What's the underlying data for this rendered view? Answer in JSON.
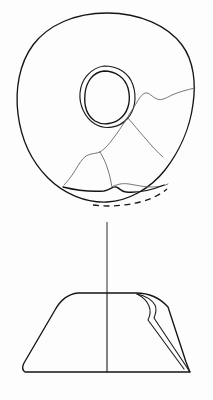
{
  "figure": {
    "background_color": "#fdfdfd",
    "line_color": "#1c1c1c",
    "crack_color": "#5e5e66",
    "canvas_width": "213",
    "canvas_height": "400"
  },
  "plan_view": {
    "label": "Plan view of perforated disc",
    "disc_outline_label": "disc outer edge",
    "perforation_outer_label": "perforation outer ring",
    "perforation_inner_label": "perforation inner ring",
    "break_edge_label": "broken lower edge",
    "hidden_profile_label": "reconstructed edge (dashed)",
    "cracks": [
      "crack-upper-right",
      "crack-mid-right",
      "crack-lower-left",
      "crack-lower-centre",
      "crack-branch-right"
    ],
    "geometry": {
      "outer_path": "M 107 13 C 140 13 168 26 182 45 C 194 61 196 84 193 104 C 190 128 179 152 165 170 C 150 189 128 201 107 202 C 86 203 64 194 48 178 C 31 161 21 138 18 114 C 15 90 19 64 33 45 C 48 25 75 13 107 13 Z",
      "perforation_outer": "M 104 66 C 118 66 129 73 133 85 C 137 97 135 111 127 119 C 119 128 105 130 95 124 C 85 118 79 105 80 93 C 81 80 90 68 104 66 Z",
      "perforation_inner": "M 104 71 C 116 71 125 78 128 88 C 131 99 129 110 122 117 C 115 124 103 126 95 121 C 86 115 84 104 85 94 C 86 82 93 72 104 71 Z",
      "break_edge": "M 63 187 C 75 190 90 192 104 191 C 110 190 113 186 116 187 C 120 188 121 192 126 192 C 138 193 152 190 164 185",
      "hidden_edge": "M 93 205 C 108 207 124 206 140 202 C 152 199 161 194 167 189"
    },
    "crack_paths": [
      "M 195 88 C 186 90 179 92 172 95 C 166 98 161 101 157 99 C 152 97 149 92 145 93 C 140 95 137 103 132 110 C 127 118 121 128 115 136 C 110 143 105 149 100 152",
      "M 100 152 C 96 154 91 153 86 156 C 82 159 79 164 76 169 C 73 174 69 180 64 185",
      "M 100 152 C 103 157 106 163 108 170 C 110 176 111 182 112 187",
      "M 112 187 C 117 184 123 183 129 184 C 136 185 143 187 151 187 C 158 187 164 186 168 184",
      "M 128 118 C 133 124 139 131 145 138 C 151 145 157 152 163 157"
    ]
  },
  "connector": {
    "label": "vertical axis line connecting views",
    "path": "M 107 222 L 107 293"
  },
  "profile_view": {
    "label": "Profile section of disc",
    "body_label": "trapezoidal body outline",
    "centre_line_label": "central section axis",
    "inner_edge_label": "interior curved edge",
    "geometry": {
      "body_path": "M 78 293 L 136 293 C 150 293 160 298 168 307 L 186 362 C 188 367 189 370 190 372 L 25 372 C 22 370 22 367 24 363 L 55 310 C 60 301 68 294 78 293 Z",
      "centre_line": "M 107 293 L 107 372",
      "inner_edge": "M 137 294 C 146 296 152 300 155 305 C 157 309 156 313 154 318 L 186 366 C 188 369 189 371 190 372",
      "inner_edge_return": "M 137 294 C 143 297 147 301 149 306 C 151 311 150 316 148 320 L 184 369"
    }
  }
}
